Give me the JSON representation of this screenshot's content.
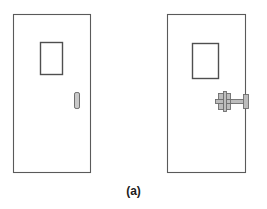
{
  "figure": {
    "caption": "(a)",
    "background_color": "#ffffff",
    "outline_color": "#5a5a5a",
    "hardware_fill": "#bdbdbd",
    "hardware_stroke": "#6e6e6e",
    "handle_fill": "#c9c9c9",
    "handle_stroke": "#6e6e6e",
    "window_fill": "#ffffff",
    "window_stroke": "#4f4f4f"
  },
  "doors": [
    {
      "id": "door-left",
      "label": "door-without-panic-hardware",
      "panel": {
        "x": 13,
        "y": 14,
        "width": 77,
        "height": 158
      },
      "vision_window": {
        "x": 40,
        "y": 42,
        "width": 22,
        "height": 32
      },
      "handle": {
        "x": 74,
        "y": 92,
        "width": 5,
        "height": 16,
        "type": "pull-handle"
      },
      "hardware": null
    },
    {
      "id": "door-right",
      "label": "door-with-panic-hardware",
      "panel": {
        "x": 167,
        "y": 14,
        "width": 78,
        "height": 158
      },
      "vision_window": {
        "x": 192,
        "y": 43,
        "width": 26,
        "height": 35
      },
      "handle": null,
      "hardware": {
        "type": "panic-bar-assembly",
        "bracket": {
          "x": 218,
          "y": 93,
          "width": 14,
          "height": 16
        },
        "rod": {
          "x": 229,
          "y": 99,
          "width": 18,
          "height": 4
        },
        "end_plate": {
          "x": 243,
          "y": 94,
          "width": 5,
          "height": 14
        }
      }
    }
  ]
}
